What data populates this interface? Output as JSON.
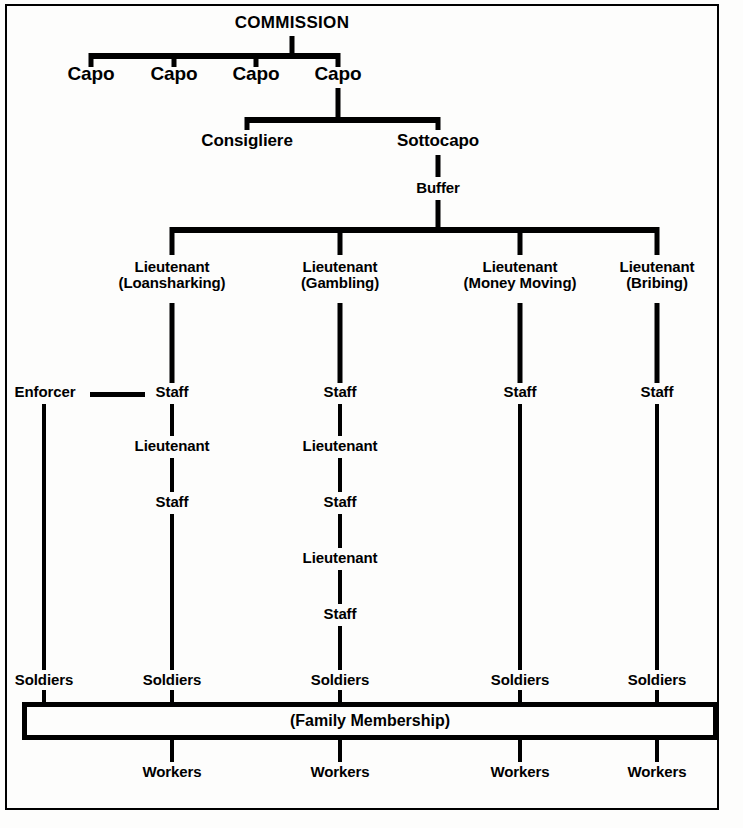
{
  "figure": {
    "type": "org-chart",
    "title": "COMMISSION",
    "border_color": "#000000",
    "background": "#fdfdfc"
  },
  "nodes": {
    "commission": "COMMISSION",
    "capo_1": "Capo",
    "capo_2": "Capo",
    "capo_3": "Capo",
    "capo_4": "Capo",
    "consigliere": "Consigliere",
    "sottocapo": "Sottocapo",
    "buffer": "Buffer",
    "lt_rank": "Lieutenant",
    "lt_loansharking_sub": "(Loansharking)",
    "lt_gambling_sub": "(Gambling)",
    "lt_moneymoving_sub": "(Money Moving)",
    "lt_bribing_sub": "(Bribing)",
    "enforcer": "Enforcer",
    "staff": "Staff",
    "lieutenant": "Lieutenant",
    "soldiers": "Soldiers",
    "workers": "Workers",
    "family_membership": "(Family Membership)"
  },
  "columns": [
    {
      "id": "enforcer",
      "lieutenant_label": null,
      "lieutenant_sub": null,
      "chain": [
        "Enforcer"
      ],
      "soldiers": "Soldiers",
      "workers": null
    },
    {
      "id": "loansharking",
      "lieutenant_label": "Lieutenant",
      "lieutenant_sub": "(Loansharking)",
      "chain": [
        "Staff",
        "Lieutenant",
        "Staff"
      ],
      "soldiers": "Soldiers",
      "workers": "Workers"
    },
    {
      "id": "gambling",
      "lieutenant_label": "Lieutenant",
      "lieutenant_sub": "(Gambling)",
      "chain": [
        "Staff",
        "Lieutenant",
        "Staff",
        "Lieutenant",
        "Staff"
      ],
      "soldiers": "Soldiers",
      "workers": "Workers"
    },
    {
      "id": "money-moving",
      "lieutenant_label": "Lieutenant",
      "lieutenant_sub": "(Money Moving)",
      "chain": [
        "Staff"
      ],
      "soldiers": "Soldiers",
      "workers": "Workers"
    },
    {
      "id": "bribing",
      "lieutenant_label": "Lieutenant",
      "lieutenant_sub": "(Bribing)",
      "chain": [
        "Staff"
      ],
      "soldiers": "Soldiers",
      "workers": "Workers"
    }
  ],
  "page_bleed_text": ""
}
